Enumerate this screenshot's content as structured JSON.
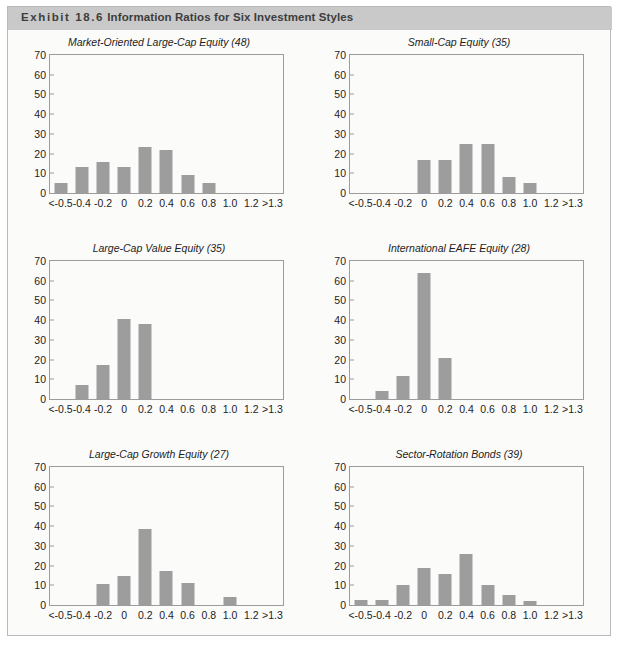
{
  "header": {
    "exhibit_label": "Exhibit 18.6",
    "title": "Information Ratios for Six Investment Styles"
  },
  "chart_data": [
    {
      "type": "bar",
      "title": "Market-Oriented Large-Cap Equity (48)",
      "xlabel": "",
      "ylabel": "",
      "ylim": [
        0,
        70
      ],
      "yticks": [
        0,
        10,
        20,
        30,
        40,
        50,
        60,
        70
      ],
      "grid": false,
      "legend": "none",
      "categories": [
        "<-0.5",
        "-0.4",
        "-0.2",
        "0",
        "0.2",
        "0.4",
        "0.6",
        "0.8",
        "1.0",
        "1.2",
        ">1.3"
      ],
      "values": [
        5,
        13,
        15.5,
        13,
        23.5,
        22,
        9,
        5,
        0,
        0,
        0
      ]
    },
    {
      "type": "bar",
      "title": "Small-Cap Equity (35)",
      "xlabel": "",
      "ylabel": "",
      "ylim": [
        0,
        70
      ],
      "yticks": [
        0,
        10,
        20,
        30,
        40,
        50,
        60,
        70
      ],
      "grid": false,
      "legend": "none",
      "categories": [
        "<-0.5",
        "-0.4",
        "-0.2",
        "0",
        "0.2",
        "0.4",
        "0.6",
        "0.8",
        "1.0",
        "1.2",
        ">1.3"
      ],
      "values": [
        0,
        0,
        0,
        17,
        17,
        25,
        25,
        8,
        5,
        0,
        0
      ]
    },
    {
      "type": "bar",
      "title": "Large-Cap Value Equity (35)",
      "xlabel": "",
      "ylabel": "",
      "ylim": [
        0,
        70
      ],
      "yticks": [
        0,
        10,
        20,
        30,
        40,
        50,
        60,
        70
      ],
      "grid": false,
      "legend": "none",
      "categories": [
        "<-0.5",
        "-0.4",
        "-0.2",
        "0",
        "0.2",
        "0.4",
        "0.6",
        "0.8",
        "1.0",
        "1.2",
        ">1.3"
      ],
      "values": [
        0,
        7,
        17.5,
        40.5,
        38,
        0,
        0,
        0,
        0,
        0,
        0
      ]
    },
    {
      "type": "bar",
      "title": "International EAFE Equity (28)",
      "xlabel": "",
      "ylabel": "",
      "ylim": [
        0,
        70
      ],
      "yticks": [
        0,
        10,
        20,
        30,
        40,
        50,
        60,
        70
      ],
      "grid": false,
      "legend": "none",
      "categories": [
        "<-0.5",
        "-0.4",
        "-0.2",
        "0",
        "0.2",
        "0.4",
        "0.6",
        "0.8",
        "1.0",
        "1.2",
        ">1.3"
      ],
      "values": [
        0,
        4,
        11.5,
        64,
        21,
        0,
        0,
        0,
        0,
        0,
        0
      ]
    },
    {
      "type": "bar",
      "title": "Large-Cap Growth Equity (27)",
      "xlabel": "",
      "ylabel": "",
      "ylim": [
        0,
        70
      ],
      "yticks": [
        0,
        10,
        20,
        30,
        40,
        50,
        60,
        70
      ],
      "grid": false,
      "legend": "none",
      "categories": [
        "<-0.5",
        "-0.4",
        "-0.2",
        "0",
        "0.2",
        "0.4",
        "0.6",
        "0.8",
        "1.0",
        "1.2",
        ">1.3"
      ],
      "values": [
        0,
        0,
        10.5,
        14.5,
        38.5,
        17.5,
        11,
        0,
        4,
        0,
        0
      ]
    },
    {
      "type": "bar",
      "title": "Sector-Rotation Bonds (39)",
      "xlabel": "",
      "ylabel": "",
      "ylim": [
        0,
        70
      ],
      "yticks": [
        0,
        10,
        20,
        30,
        40,
        50,
        60,
        70
      ],
      "grid": false,
      "legend": "none",
      "categories": [
        "<-0.5",
        "-0.4",
        "-0.2",
        "0",
        "0.2",
        "0.4",
        "0.6",
        "0.8",
        "1.0",
        "1.2",
        ">1.3"
      ],
      "values": [
        2.5,
        2.5,
        10,
        19,
        15.5,
        26,
        10,
        5,
        2,
        0,
        0
      ]
    }
  ],
  "colors": {
    "bar": "#9d9d9d",
    "header_band": "#c9c9c9",
    "frame": "#9c9c9c",
    "page": "#fbfbfa"
  }
}
